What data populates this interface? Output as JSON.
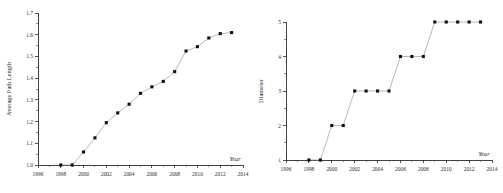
{
  "figure": {
    "background_color": "#ffffff",
    "marker_color": "#111111",
    "line_color": "#9a9a9a",
    "axis_color": "#2b2b2b"
  },
  "chart_data": [
    {
      "type": "line",
      "panel": "left",
      "title": "",
      "xlabel": "Year",
      "ylabel": "Average Path Length",
      "xlim": [
        1996,
        2014
      ],
      "ylim": [
        1.0,
        1.7
      ],
      "grid": false,
      "legend": false,
      "xticks": [
        1996,
        1998,
        2000,
        2002,
        2004,
        2006,
        2008,
        2010,
        2012,
        2014
      ],
      "xtick_labels": [
        "1996",
        "1998",
        "2000",
        "2002",
        "2004",
        "2006",
        "2008",
        "2010",
        "2012",
        "2014"
      ],
      "yticks": [
        1.0,
        1.1,
        1.2,
        1.3,
        1.4,
        1.5,
        1.6,
        1.7
      ],
      "ytick_labels": [
        "1.0",
        "1.1",
        "1.2",
        "1.3",
        "1.4",
        "1.5",
        "1.6",
        "1.7"
      ],
      "x": [
        1998,
        1999,
        2000,
        2001,
        2002,
        2003,
        2004,
        2005,
        2006,
        2007,
        2008,
        2009,
        2010,
        2011,
        2012,
        2013
      ],
      "values": [
        1.0,
        1.0,
        1.06,
        1.125,
        1.195,
        1.24,
        1.28,
        1.33,
        1.36,
        1.385,
        1.43,
        1.525,
        1.545,
        1.585,
        1.605,
        1.61
      ],
      "marker": "square",
      "marker_size": 3.1
    },
    {
      "type": "line",
      "panel": "right",
      "title": "",
      "xlabel": "Year",
      "ylabel": "Diameter",
      "xlim": [
        1996,
        2014
      ],
      "ylim": [
        1,
        5
      ],
      "grid": false,
      "legend": false,
      "xticks": [
        1996,
        1998,
        2000,
        2002,
        2004,
        2006,
        2008,
        2010,
        2012,
        2014
      ],
      "xtick_labels": [
        "1996",
        "1998",
        "2000",
        "2002",
        "2004",
        "2006",
        "2008",
        "2010",
        "2012",
        "2014"
      ],
      "yticks": [
        1,
        2,
        3,
        4,
        5
      ],
      "ytick_labels": [
        "1",
        "2",
        "3",
        "4",
        "5"
      ],
      "x": [
        1998,
        1999,
        2000,
        2001,
        2002,
        2003,
        2004,
        2005,
        2006,
        2007,
        2008,
        2009,
        2010,
        2011,
        2012,
        2013
      ],
      "values": [
        1,
        1,
        2,
        2,
        3,
        3,
        3,
        3,
        4,
        4,
        4,
        5,
        5,
        5,
        5,
        5
      ],
      "marker": "square",
      "marker_size": 3.1
    }
  ]
}
